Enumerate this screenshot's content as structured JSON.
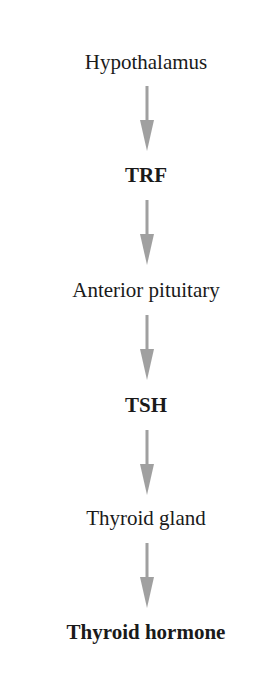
{
  "diagram": {
    "type": "flowchart",
    "direction": "top-to-bottom",
    "arrow_color": "#a0a0a0",
    "nodes": [
      {
        "label": "Hypothalamus",
        "bold": false
      },
      {
        "label": "TRF",
        "bold": true
      },
      {
        "label": "Anterior pituitary",
        "bold": false
      },
      {
        "label": "TSH",
        "bold": true
      },
      {
        "label": "Thyroid gland",
        "bold": false
      },
      {
        "label": "Thyroid hormone",
        "bold": true
      }
    ],
    "edges": [
      {
        "from": "Hypothalamus",
        "to": "TRF"
      },
      {
        "from": "TRF",
        "to": "Anterior pituitary"
      },
      {
        "from": "Anterior pituitary",
        "to": "TSH"
      },
      {
        "from": "TSH",
        "to": "Thyroid gland"
      },
      {
        "from": "Thyroid gland",
        "to": "Thyroid hormone"
      }
    ]
  }
}
